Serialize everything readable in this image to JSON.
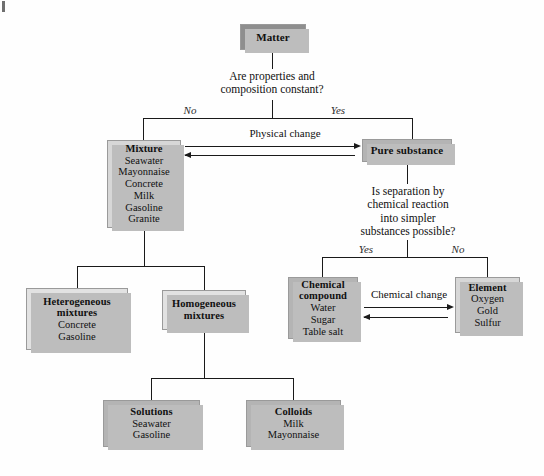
{
  "diagram": {
    "nodes": {
      "matter": {
        "title": "Matter",
        "items": []
      },
      "mixture": {
        "title": "Mixture",
        "items": [
          "Seawater",
          "Mayonnaise",
          "Concrete",
          "Milk",
          "Gasoline",
          "Granite"
        ]
      },
      "pure": {
        "title": "Pure substance",
        "items": []
      },
      "heterogeneous": {
        "title": "Heterogeneous",
        "title2": "mixtures",
        "items": [
          "Concrete",
          "Gasoline"
        ]
      },
      "homogeneous": {
        "title": "Homogeneous",
        "title2": "mixtures",
        "items": []
      },
      "compound": {
        "title": "Chemical",
        "title2": "compound",
        "items": [
          "Water",
          "Sugar",
          "Table salt"
        ]
      },
      "element": {
        "title": "Element",
        "items": [
          "Oxygen",
          "Gold",
          "Sulfur"
        ]
      },
      "solutions": {
        "title": "Solutions",
        "items": [
          "Seawater",
          "Gasoline"
        ]
      },
      "colloids": {
        "title": "Colloids",
        "items": [
          "Milk",
          "Mayonnaise"
        ]
      }
    },
    "questions": {
      "q1_line1": "Are properties and",
      "q1_line2": "composition constant?",
      "q2_line1": "Is separation by",
      "q2_line2": "chemical reaction",
      "q2_line3": "into simpler",
      "q2_line4": "substances possible?"
    },
    "branch_labels": {
      "q1_no": "No",
      "q1_yes": "Yes",
      "q2_yes": "Yes",
      "q2_no": "No"
    },
    "edge_labels": {
      "physical_change": "Physical change",
      "chemical_change": "Chemical change"
    },
    "colors": {
      "node_dark": "#8e8e8e",
      "node_mid": "#b4b4b4",
      "node_light": "#d7d7d7",
      "node_pale": "#e2e2e2",
      "line": "#1a1a1a",
      "shadow": "#bdbdbd"
    }
  }
}
